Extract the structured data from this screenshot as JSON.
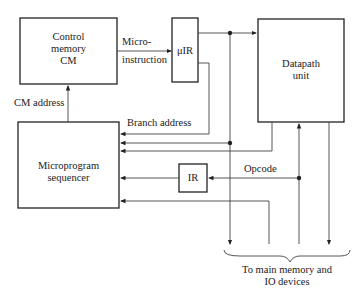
{
  "diagram": {
    "blocks": {
      "control_memory": {
        "line1": "Control",
        "line2": "memory",
        "line3": "CM"
      },
      "micro_ir": {
        "label": "μIR"
      },
      "datapath": {
        "line1": "Datapath",
        "line2": "unit"
      },
      "sequencer": {
        "line1": "Microprogram",
        "line2": "sequencer"
      },
      "ir": {
        "label": "IR"
      }
    },
    "signals": {
      "microinstruction_line1": "Micro-",
      "microinstruction_line2": "instruction",
      "cm_address": "CM address",
      "branch_address": "Branch address",
      "opcode": "Opcode"
    },
    "footer": {
      "line1": "To main memory and",
      "line2": "IO devices"
    },
    "colors": {
      "stroke": "#222222",
      "thin": "#555555"
    }
  }
}
